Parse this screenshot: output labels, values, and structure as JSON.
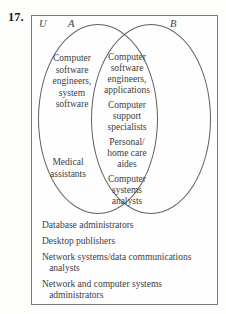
{
  "problem_number": "17.",
  "diagram": {
    "universal_set_label": "U",
    "set_a_label": "A",
    "set_b_label": "B",
    "regions": {
      "a_only": [
        "Computer\nsoftware\nengineers,\nsystem\nsoftware",
        "Medical\nassistants"
      ],
      "intersection": [
        "Computer\nsoftware\nengineers,\napplications",
        "Computer\nsupport\nspecialists",
        "Personal/\nhome care\naides",
        "Computer\nsystems\nanalysts"
      ],
      "b_only": [],
      "outside": [
        "Database administrators",
        "Desktop publishers",
        "Network systems/data communications\n   analysts",
        "Network and computer systems\n   administrators"
      ]
    },
    "colors": {
      "stroke": "#5f5f5f",
      "text": "#3d3d3d",
      "background": "#fefefe"
    }
  }
}
